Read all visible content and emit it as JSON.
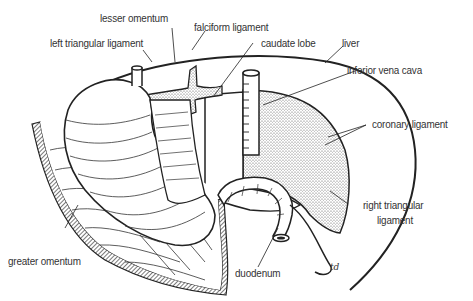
{
  "diagram": {
    "type": "anatomical line drawing",
    "labels": {
      "lesser_omentum": "lesser omentum",
      "falciform_ligament": "falciform ligament",
      "left_triangular_ligament": "left triangular ligament",
      "caudate_lobe": "caudate lobe",
      "liver": "liver",
      "inferior_vena_cava": "inferior vena cava",
      "coronary_ligament": "coronary ligament",
      "right_triangular_ligament_1": "right triangular",
      "right_triangular_ligament_2": "ligament",
      "greater_omentum": "greater omentum",
      "duodenum": "duodenum"
    },
    "signature": "td",
    "colors": {
      "line": "#222222",
      "stipple": "#b8b8b8",
      "text": "#333333",
      "background": "#ffffff"
    }
  }
}
